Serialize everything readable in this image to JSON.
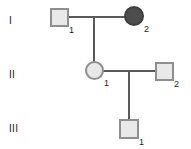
{
  "figure": {
    "type": "pedigree-chart",
    "background_color": "#ffffff",
    "line_color": "#5a5a5a",
    "unaffected_fill": "#e9e9e9",
    "affected_fill": "#4d4d4d",
    "symbol_border_color": "#8f8f8f"
  },
  "generations": [
    {
      "numeral": "I"
    },
    {
      "numeral": "II"
    },
    {
      "numeral": "III"
    }
  ],
  "individuals": [
    {
      "id": "I-1",
      "number": "1",
      "sex": "male",
      "shape": "square",
      "status": "unaffected",
      "generation": "I"
    },
    {
      "id": "I-2",
      "number": "2",
      "sex": "female",
      "shape": "circle",
      "status": "affected",
      "generation": "I"
    },
    {
      "id": "II-1",
      "number": "1",
      "sex": "female",
      "shape": "circle",
      "status": "unaffected",
      "generation": "II"
    },
    {
      "id": "II-2",
      "number": "2",
      "sex": "male",
      "shape": "square",
      "status": "unaffected",
      "generation": "II"
    },
    {
      "id": "III-1",
      "number": "1",
      "sex": "male",
      "shape": "square",
      "status": "unaffected",
      "generation": "III"
    }
  ],
  "matings": [
    {
      "id": "mating-I",
      "partners": [
        "I-1",
        "I-2"
      ],
      "children": [
        "II-1"
      ]
    },
    {
      "id": "mating-II",
      "partners": [
        "II-1",
        "II-2"
      ],
      "children": [
        "III-1"
      ]
    }
  ]
}
